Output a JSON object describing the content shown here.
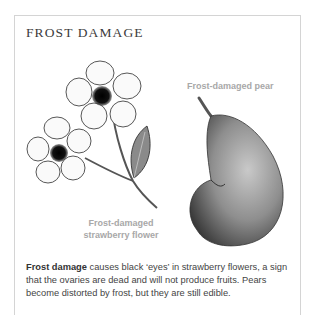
{
  "panel": {
    "title": "FROST DAMAGE",
    "labels": {
      "pear": "Frost-damaged pear",
      "flower_line1": "Frost-damaged",
      "flower_line2": "strawberry flower"
    },
    "caption": {
      "bold": "Frost damage",
      "text": " causes black ‘eyes’ in strawberry flowers, a sign that the ovaries are dead and will not produce fruits. Pears become distorted by frost, but they are still edible."
    },
    "colors": {
      "border": "#d4d4d4",
      "title": "#3c3c3c",
      "label": "#a8a8a8",
      "body_text": "#444444"
    }
  }
}
